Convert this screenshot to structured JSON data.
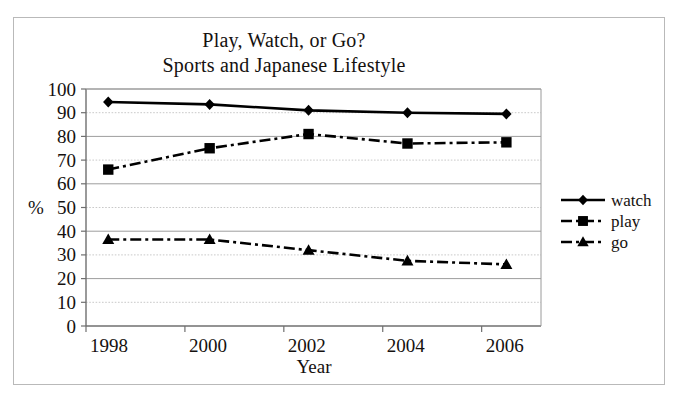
{
  "chart_data": {
    "type": "line",
    "title": "Play, Watch, or Go?",
    "subtitle": "Sports and Japanese Lifestyle",
    "xlabel": "Year",
    "ylabel": "%",
    "xlim": [
      1998,
      2007.2
    ],
    "ylim": [
      0,
      100
    ],
    "xticks": [
      "1998",
      "2000",
      "2002",
      "2004",
      "2006"
    ],
    "xtick_values": [
      1998,
      2000,
      2002,
      2004,
      2006
    ],
    "yticks": [
      "0",
      "10",
      "20",
      "30",
      "40",
      "50",
      "60",
      "70",
      "80",
      "90",
      "100"
    ],
    "ytick_values": [
      0,
      10,
      20,
      30,
      40,
      50,
      60,
      70,
      80,
      90,
      100
    ],
    "grid": true,
    "legend_position": "right",
    "x": [
      1998.45,
      2000.5,
      2002.5,
      2004.5,
      2006.5
    ],
    "series": [
      {
        "name": "watch",
        "marker": "diamond",
        "linestyle": "solid",
        "color": "#000000",
        "values": [
          94.5,
          93.5,
          91,
          90,
          89.5
        ]
      },
      {
        "name": "play",
        "marker": "square",
        "linestyle": "dash-dot",
        "color": "#000000",
        "values": [
          66,
          75,
          81,
          77,
          77.5
        ]
      },
      {
        "name": "go",
        "marker": "triangle",
        "linestyle": "dash-dot",
        "color": "#000000",
        "values": [
          36.5,
          36.5,
          32,
          27.5,
          26
        ]
      }
    ]
  },
  "legend": {
    "items": [
      {
        "label": "watch"
      },
      {
        "label": "play"
      },
      {
        "label": "go"
      }
    ]
  },
  "colors": {
    "ink": "#15110f",
    "frame": "#b9b9b9",
    "grid": "#a9a9a9",
    "axis": "#6f6f6f"
  }
}
